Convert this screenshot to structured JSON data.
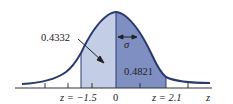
{
  "figure": {
    "type": "standard-normal-curve",
    "axis_label": "z",
    "mean_label": "0",
    "sigma_label": "σ",
    "left_bound_label": "z = −1.5",
    "right_bound_label": "z = 2.1",
    "left_area_label": "0.4332",
    "right_area_label": "0.4821",
    "colors": {
      "curve": "#2a3a6e",
      "left_fill": "#c3cde6",
      "right_fill": "#7f8fc2",
      "axis": "#333333"
    },
    "regions": [
      {
        "from": -1.5,
        "to": 0,
        "area": 0.4332
      },
      {
        "from": 0,
        "to": 2.1,
        "area": 0.4821
      }
    ]
  }
}
